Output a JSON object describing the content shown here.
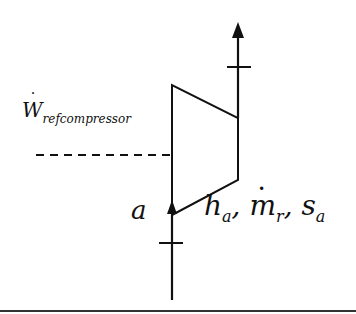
{
  "diagram": {
    "type": "compressor schematic",
    "work_label": {
      "symbol": "W",
      "subscript": "refcompressor",
      "has_dot": true
    },
    "state_label": "a",
    "properties": [
      {
        "symbol": "h",
        "subscript": "a",
        "sep": ","
      },
      {
        "symbol": "m",
        "subscript": "r",
        "has_dot": true,
        "sep": ","
      },
      {
        "symbol": "s",
        "subscript": "a",
        "sep": ""
      }
    ],
    "colors": {
      "line": "#111111",
      "background": "#ffffff"
    }
  }
}
